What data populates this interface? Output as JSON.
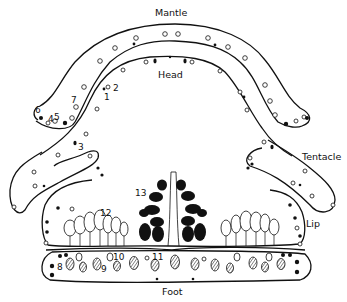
{
  "figure": {
    "type": "anatomical-diagram",
    "regions": {
      "mantle": "Mantle",
      "head": "Head",
      "tentacle": "Tentacle",
      "lip": "Lip",
      "foot": "Foot"
    },
    "cell_labels": [
      "1",
      "2",
      "3",
      "4",
      "5",
      "6",
      "7",
      "8",
      "9",
      "10",
      "11",
      "12",
      "13"
    ],
    "colors": {
      "ink": "#111111",
      "background": "#ffffff"
    }
  }
}
